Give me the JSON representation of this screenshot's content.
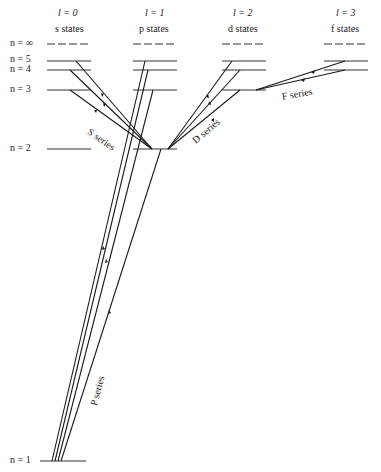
{
  "columns": [
    {
      "l_label": "l = 0",
      "state_label": "s states",
      "x": 69
    },
    {
      "l_label": "l = 1",
      "state_label": "p states",
      "x": 155
    },
    {
      "l_label": "l = 2",
      "state_label": "d states",
      "x": 244
    },
    {
      "l_label": "l = 3",
      "state_label": "f states",
      "x": 346
    }
  ],
  "levels": [
    {
      "label": "n = ∞",
      "y": 44
    },
    {
      "label": "n = 5",
      "y": 61
    },
    {
      "label": "n = 4",
      "y": 70
    },
    {
      "label": "n = 3",
      "y": 90
    },
    {
      "label": "n = 2",
      "y": 149
    },
    {
      "label": "n = 1",
      "y": 461
    }
  ],
  "series": {
    "s": "S series",
    "d": "D series",
    "f": "F series",
    "p": "P series"
  },
  "colors": {
    "line": "#1a1a1a",
    "level": "#333333"
  }
}
